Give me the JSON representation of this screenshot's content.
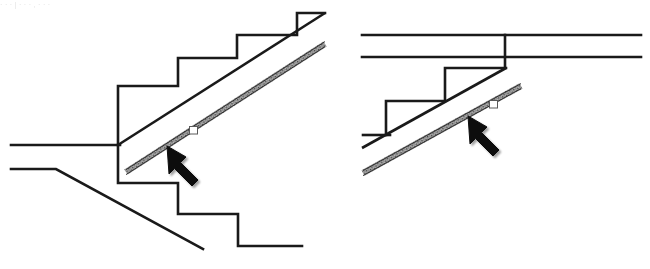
{
  "figure": {
    "background_color": "#ffffff",
    "line_color": "#1a1a1a",
    "band_fill_color": "#8a8a8a",
    "band_edge_color": "#3d3d3d",
    "arrow_color": "#111111",
    "marker_fill_color": "#ffffff",
    "marker_edge_color": "#555555",
    "faint_caption_remnant": "· · ·   |   · · ·   ,   · · ·",
    "panels": [
      {
        "id": "left-panel",
        "name": "left-stair-section",
        "label": "Left stair section with sloped nosing band",
        "step_count": 5,
        "annotation": {
          "arrow_name": "pointer-arrow",
          "arrow_direction": "up-left",
          "marker_name": "cursor-square-marker",
          "points_at": "hatched sloped band"
        },
        "band": {
          "name": "hatched-sloped-band",
          "orientation": "diagonal-up-right",
          "hatch_pattern": "fine-stipple"
        },
        "floor_lines": 2,
        "lower_stair_count": 2
      },
      {
        "id": "right-panel",
        "name": "right-stair-section",
        "label": "Right stair section with sloped nosing band under double ceiling lines",
        "step_count": 2,
        "annotation": {
          "arrow_name": "pointer-arrow",
          "arrow_direction": "up-left",
          "marker_name": "cursor-square-marker",
          "points_at": "hatched sloped band"
        },
        "band": {
          "name": "hatched-sloped-band",
          "orientation": "diagonal-up-right",
          "hatch_pattern": "fine-stipple"
        },
        "ceiling_lines": 2
      }
    ]
  }
}
